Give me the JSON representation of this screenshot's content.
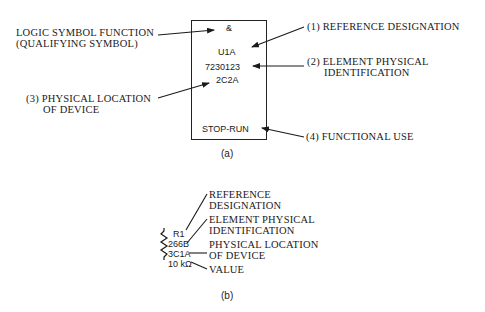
{
  "figure_a": {
    "label": "(a)",
    "box": {
      "qualifier": "&",
      "reference": "U1A",
      "element_id": "7230123",
      "location": "2C2A",
      "function": "STOP-RUN"
    },
    "callouts": {
      "logic_line1": "LOGIC SYMBOL FUNCTION",
      "logic_line2": "(QUALIFYING SYMBOL)",
      "ref_line1": "(1) REFERENCE DESIGNATION",
      "elem_line1": "(2) ELEMENT PHYSICAL",
      "elem_line2": "IDENTIFICATION",
      "loc_line1": "(3) PHYSICAL LOCATION",
      "loc_line2": "OF DEVICE",
      "func_line1": "(4) FUNCTIONAL USE"
    }
  },
  "figure_b": {
    "label": "(b)",
    "resistor": {
      "reference": "R1",
      "element_id": "266B",
      "location": "3C1A",
      "value": "10 kΩ"
    },
    "callouts": {
      "ref_line1": "REFERENCE",
      "ref_line2": "DESIGNATION",
      "elem_line1": "ELEMENT PHYSICAL",
      "elem_line2": "IDENTIFICATION",
      "loc_line1": "PHYSICAL LOCATION",
      "loc_line2": "OF DEVICE",
      "value_line1": "VALUE"
    }
  }
}
